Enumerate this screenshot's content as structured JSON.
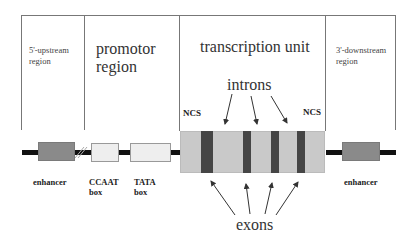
{
  "diagram": {
    "regions": [
      {
        "id": "upstream",
        "label": "5'-upstream region"
      },
      {
        "id": "promotor",
        "label_line1": "promotor",
        "label_line2": "region"
      },
      {
        "id": "transcription",
        "label": "transcription unit"
      },
      {
        "id": "downstream",
        "label": "3'-downstream region"
      }
    ],
    "upstream_line1": "5'-upstream",
    "upstream_line2": "region",
    "downstream_line1": "3'-downstream",
    "downstream_line2": "region",
    "introns_label": "introns",
    "exons_label": "exons",
    "ncs_left": "NCS",
    "ncs_right": "NCS",
    "elements": {
      "enhancer_left": "enhancer",
      "ccaat_line1": "CCAAT",
      "ccaat_line2": "box",
      "tata_line1": "TATA",
      "tata_line2": "box",
      "enhancer_right": "enhancer"
    },
    "colors": {
      "enhancer": "#8a8a8a",
      "promoter_box": "#eeeeee",
      "transcription_unit": "#c9c9c9",
      "exon": "#454545",
      "dna": "#111111",
      "frame": "#777777"
    }
  }
}
